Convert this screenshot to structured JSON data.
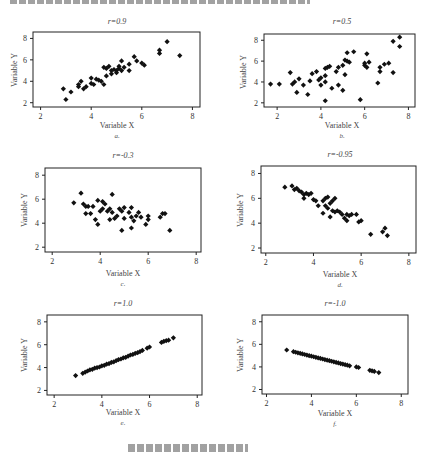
{
  "figure": {
    "panels": [
      {
        "id": "a",
        "title": "r=0.9",
        "xlabel": "Variable X",
        "ylabel": "Variable Y",
        "sublabel": "a."
      },
      {
        "id": "b",
        "title": "r=0.5",
        "xlabel": "Variable X",
        "ylabel": "Variable Y",
        "sublabel": "b."
      },
      {
        "id": "c",
        "title": "r=-0.3",
        "xlabel": "Variable X",
        "ylabel": "Variable Y",
        "sublabel": "c."
      },
      {
        "id": "d",
        "title": "r=-0.95",
        "xlabel": "Variable X",
        "ylabel": "Variable Y",
        "sublabel": "d."
      },
      {
        "id": "e",
        "title": "r=1.0",
        "xlabel": "Variable X",
        "ylabel": "Variable Y",
        "sublabel": "e."
      },
      {
        "id": "f",
        "title": "r=-1.0",
        "xlabel": "Variable X",
        "ylabel": "Variable Y",
        "sublabel": "f."
      }
    ]
  },
  "chart_data": [
    {
      "type": "scatter",
      "title": "r=0.9",
      "xlabel": "Variable X",
      "ylabel": "Variable Y",
      "xlim": [
        1.7,
        8.3
      ],
      "ylim": [
        1.6,
        8.6
      ],
      "xticks": [
        2,
        4,
        6,
        8
      ],
      "yticks": [
        2,
        4,
        6,
        8
      ],
      "grid": false,
      "points": [
        [
          2.9,
          3.3
        ],
        [
          3.0,
          2.3
        ],
        [
          3.2,
          3.0
        ],
        [
          3.5,
          3.5
        ],
        [
          3.5,
          3.7
        ],
        [
          3.6,
          4.0
        ],
        [
          3.7,
          3.3
        ],
        [
          3.8,
          3.5
        ],
        [
          4.0,
          4.3
        ],
        [
          4.0,
          3.8
        ],
        [
          4.1,
          3.7
        ],
        [
          4.2,
          4.2
        ],
        [
          4.3,
          4.1
        ],
        [
          4.4,
          4.0
        ],
        [
          4.5,
          5.3
        ],
        [
          4.5,
          3.7
        ],
        [
          4.6,
          5.2
        ],
        [
          4.6,
          4.5
        ],
        [
          4.7,
          5.4
        ],
        [
          4.8,
          5.0
        ],
        [
          4.8,
          4.7
        ],
        [
          4.9,
          5.1
        ],
        [
          5.0,
          5.0
        ],
        [
          5.0,
          4.8
        ],
        [
          5.1,
          5.4
        ],
        [
          5.1,
          5.2
        ],
        [
          5.2,
          5.9
        ],
        [
          5.2,
          5.0
        ],
        [
          5.3,
          5.3
        ],
        [
          5.5,
          5.6
        ],
        [
          5.5,
          5.0
        ],
        [
          5.7,
          6.3
        ],
        [
          5.8,
          5.9
        ],
        [
          6.0,
          5.7
        ],
        [
          6.1,
          5.5
        ],
        [
          6.7,
          6.9
        ],
        [
          6.7,
          6.6
        ],
        [
          7.0,
          7.7
        ],
        [
          7.5,
          6.4
        ]
      ]
    },
    {
      "type": "scatter",
      "title": "r=0.5",
      "xlabel": "Variable X",
      "ylabel": "Variable Y",
      "xlim": [
        1.4,
        8.3
      ],
      "ylim": [
        1.6,
        8.6
      ],
      "xticks": [
        2,
        4,
        6,
        8
      ],
      "yticks": [
        2,
        4,
        6,
        8
      ],
      "grid": false,
      "points": [
        [
          1.7,
          3.8
        ],
        [
          2.1,
          3.8
        ],
        [
          2.6,
          4.9
        ],
        [
          2.7,
          3.8
        ],
        [
          2.8,
          4.0
        ],
        [
          2.9,
          3.0
        ],
        [
          3.0,
          4.3
        ],
        [
          3.2,
          3.7
        ],
        [
          3.4,
          2.8
        ],
        [
          3.5,
          4.1
        ],
        [
          3.6,
          4.8
        ],
        [
          3.8,
          5.0
        ],
        [
          3.9,
          4.2
        ],
        [
          4.0,
          4.4
        ],
        [
          4.0,
          3.7
        ],
        [
          4.2,
          5.3
        ],
        [
          4.2,
          4.6
        ],
        [
          4.2,
          4.0
        ],
        [
          4.2,
          2.2
        ],
        [
          4.3,
          5.4
        ],
        [
          4.4,
          5.5
        ],
        [
          4.5,
          3.4
        ],
        [
          4.7,
          5.0
        ],
        [
          4.8,
          5.4
        ],
        [
          4.8,
          3.7
        ],
        [
          5.0,
          3.2
        ],
        [
          5.0,
          5.6
        ],
        [
          5.1,
          6.1
        ],
        [
          5.1,
          4.7
        ],
        [
          5.2,
          6.8
        ],
        [
          5.2,
          6.0
        ],
        [
          5.3,
          5.9
        ],
        [
          5.5,
          6.9
        ],
        [
          5.8,
          2.3
        ],
        [
          6.0,
          5.8
        ],
        [
          6.0,
          5.6
        ],
        [
          6.1,
          6.7
        ],
        [
          6.1,
          5.4
        ],
        [
          6.2,
          5.9
        ],
        [
          6.6,
          3.9
        ],
        [
          6.7,
          5.4
        ],
        [
          6.7,
          5.0
        ],
        [
          6.9,
          5.7
        ],
        [
          7.1,
          5.8
        ],
        [
          7.3,
          4.9
        ],
        [
          7.3,
          7.9
        ],
        [
          7.6,
          8.3
        ],
        [
          7.6,
          7.4
        ]
      ]
    },
    {
      "type": "scatter",
      "title": "r=-0.3",
      "xlabel": "Variable X",
      "ylabel": "Variable Y",
      "xlim": [
        1.7,
        8.2
      ],
      "ylim": [
        1.6,
        8.6
      ],
      "xticks": [
        2,
        4,
        6,
        8
      ],
      "yticks": [
        2,
        4,
        6,
        8
      ],
      "grid": false,
      "points": [
        [
          2.9,
          5.7
        ],
        [
          3.2,
          6.5
        ],
        [
          3.3,
          5.6
        ],
        [
          3.4,
          5.4
        ],
        [
          3.4,
          4.8
        ],
        [
          3.5,
          5.4
        ],
        [
          3.6,
          4.8
        ],
        [
          3.7,
          5.4
        ],
        [
          3.8,
          4.3
        ],
        [
          3.9,
          3.9
        ],
        [
          3.9,
          5.9
        ],
        [
          4.0,
          5.0
        ],
        [
          4.1,
          5.8
        ],
        [
          4.1,
          5.2
        ],
        [
          4.2,
          5.6
        ],
        [
          4.3,
          5.0
        ],
        [
          4.4,
          5.2
        ],
        [
          4.4,
          4.3
        ],
        [
          4.5,
          6.4
        ],
        [
          4.5,
          4.9
        ],
        [
          4.6,
          4.4
        ],
        [
          4.7,
          4.6
        ],
        [
          4.8,
          5.2
        ],
        [
          4.9,
          5.0
        ],
        [
          4.9,
          3.4
        ],
        [
          5.0,
          5.3
        ],
        [
          5.0,
          4.4
        ],
        [
          5.2,
          4.9
        ],
        [
          5.3,
          5.3
        ],
        [
          5.3,
          4.5
        ],
        [
          5.3,
          3.6
        ],
        [
          5.4,
          4.2
        ],
        [
          5.5,
          4.6
        ],
        [
          5.6,
          4.9
        ],
        [
          5.7,
          4.5
        ],
        [
          5.9,
          3.9
        ],
        [
          6.0,
          4.6
        ],
        [
          6.0,
          4.3
        ],
        [
          6.5,
          4.5
        ],
        [
          6.6,
          4.8
        ],
        [
          6.7,
          4.8
        ],
        [
          6.9,
          3.4
        ]
      ]
    },
    {
      "type": "scatter",
      "title": "r=-0.95",
      "xlabel": "Variable X",
      "ylabel": "Variable Y",
      "xlim": [
        1.8,
        8.3
      ],
      "ylim": [
        1.6,
        8.6
      ],
      "xticks": [
        2,
        4,
        6,
        8
      ],
      "yticks": [
        2,
        4,
        6,
        8
      ],
      "grid": false,
      "points": [
        [
          2.8,
          6.9
        ],
        [
          3.1,
          7.0
        ],
        [
          3.2,
          6.7
        ],
        [
          3.3,
          6.8
        ],
        [
          3.4,
          6.6
        ],
        [
          3.5,
          6.5
        ],
        [
          3.6,
          6.3
        ],
        [
          3.6,
          6.0
        ],
        [
          3.7,
          6.4
        ],
        [
          3.8,
          6.3
        ],
        [
          3.9,
          6.4
        ],
        [
          4.0,
          5.9
        ],
        [
          4.1,
          5.8
        ],
        [
          4.2,
          5.4
        ],
        [
          4.4,
          4.8
        ],
        [
          4.4,
          5.8
        ],
        [
          4.5,
          5.4
        ],
        [
          4.5,
          6.0
        ],
        [
          4.6,
          5.2
        ],
        [
          4.6,
          6.1
        ],
        [
          4.7,
          5.6
        ],
        [
          4.7,
          4.5
        ],
        [
          4.8,
          5.8
        ],
        [
          4.8,
          5.0
        ],
        [
          4.9,
          6.0
        ],
        [
          4.9,
          4.9
        ],
        [
          5.0,
          5.0
        ],
        [
          5.1,
          4.9
        ],
        [
          5.2,
          4.7
        ],
        [
          5.3,
          4.4
        ],
        [
          5.4,
          4.2
        ],
        [
          5.4,
          4.7
        ],
        [
          5.5,
          4.6
        ],
        [
          5.6,
          4.7
        ],
        [
          5.8,
          4.7
        ],
        [
          5.9,
          4.1
        ],
        [
          6.0,
          4.2
        ],
        [
          6.4,
          3.1
        ],
        [
          6.9,
          3.3
        ],
        [
          7.0,
          3.6
        ],
        [
          7.1,
          3.0
        ]
      ]
    },
    {
      "type": "scatter",
      "title": "r=1.0",
      "xlabel": "Variable X",
      "ylabel": "Variable Y",
      "xlim": [
        1.7,
        8.2
      ],
      "ylim": [
        1.6,
        8.6
      ],
      "xticks": [
        2,
        4,
        6,
        8
      ],
      "yticks": [
        2,
        4,
        6,
        8
      ],
      "grid": false,
      "points": [
        [
          2.9,
          3.3
        ],
        [
          3.2,
          3.5
        ],
        [
          3.3,
          3.6
        ],
        [
          3.4,
          3.7
        ],
        [
          3.5,
          3.8
        ],
        [
          3.6,
          3.85
        ],
        [
          3.7,
          3.95
        ],
        [
          3.8,
          4.0
        ],
        [
          3.9,
          4.05
        ],
        [
          4.0,
          4.15
        ],
        [
          4.1,
          4.2
        ],
        [
          4.2,
          4.3
        ],
        [
          4.3,
          4.35
        ],
        [
          4.4,
          4.45
        ],
        [
          4.5,
          4.5
        ],
        [
          4.6,
          4.6
        ],
        [
          4.7,
          4.7
        ],
        [
          4.8,
          4.75
        ],
        [
          4.9,
          4.85
        ],
        [
          5.0,
          4.9
        ],
        [
          5.1,
          5.0
        ],
        [
          5.2,
          5.1
        ],
        [
          5.3,
          5.15
        ],
        [
          5.4,
          5.25
        ],
        [
          5.5,
          5.3
        ],
        [
          5.6,
          5.4
        ],
        [
          5.7,
          5.5
        ],
        [
          5.9,
          5.7
        ],
        [
          6.0,
          5.8
        ],
        [
          6.5,
          6.2
        ],
        [
          6.6,
          6.3
        ],
        [
          6.7,
          6.35
        ],
        [
          6.8,
          6.4
        ],
        [
          7.0,
          6.6
        ]
      ]
    },
    {
      "type": "scatter",
      "title": "r=-1.0",
      "xlabel": "Variable X",
      "ylabel": "Variable Y",
      "xlim": [
        1.8,
        8.3
      ],
      "ylim": [
        1.6,
        8.6
      ],
      "xticks": [
        2,
        4,
        6,
        8
      ],
      "yticks": [
        2,
        4,
        6,
        8
      ],
      "grid": false,
      "points": [
        [
          2.9,
          5.5
        ],
        [
          3.2,
          5.35
        ],
        [
          3.3,
          5.3
        ],
        [
          3.4,
          5.25
        ],
        [
          3.5,
          5.2
        ],
        [
          3.6,
          5.15
        ],
        [
          3.7,
          5.1
        ],
        [
          3.8,
          5.05
        ],
        [
          3.9,
          5.0
        ],
        [
          4.0,
          4.95
        ],
        [
          4.1,
          4.9
        ],
        [
          4.2,
          4.85
        ],
        [
          4.3,
          4.8
        ],
        [
          4.4,
          4.75
        ],
        [
          4.5,
          4.7
        ],
        [
          4.6,
          4.65
        ],
        [
          4.7,
          4.6
        ],
        [
          4.8,
          4.55
        ],
        [
          4.9,
          4.5
        ],
        [
          5.0,
          4.45
        ],
        [
          5.1,
          4.4
        ],
        [
          5.2,
          4.35
        ],
        [
          5.3,
          4.3
        ],
        [
          5.4,
          4.25
        ],
        [
          5.5,
          4.2
        ],
        [
          5.6,
          4.15
        ],
        [
          5.7,
          4.1
        ],
        [
          6.0,
          4.0
        ],
        [
          6.1,
          3.95
        ],
        [
          6.6,
          3.7
        ],
        [
          6.7,
          3.65
        ],
        [
          6.8,
          3.6
        ],
        [
          7.0,
          3.5
        ]
      ]
    }
  ]
}
